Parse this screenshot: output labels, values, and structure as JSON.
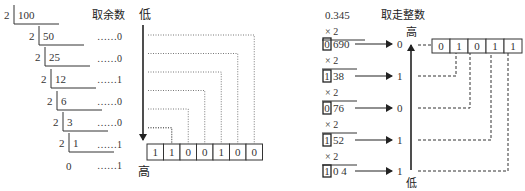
{
  "left": {
    "title": "取余数",
    "divisor": "2",
    "dividends": [
      "100",
      "50",
      "25",
      "12",
      "6",
      "3",
      "1"
    ],
    "final_quotient": "0",
    "remainders": [
      "……0",
      "……0",
      "……1",
      "……0",
      "……0",
      "……1",
      "……1"
    ],
    "arrow_top_label": "低",
    "arrow_bottom_label": "高",
    "result_bits": [
      "1",
      "1",
      "0",
      "0",
      "1",
      "0",
      "0"
    ]
  },
  "right": {
    "title": "取走整数",
    "multiplicand": "0.345",
    "multiplier": "× 2",
    "products": [
      {
        "int": "0",
        "frac": "690",
        "bit": "0"
      },
      {
        "int": "1",
        "frac": "38",
        "bit": "1"
      },
      {
        "int": "0",
        "frac": "76",
        "bit": "0"
      },
      {
        "int": "1",
        "frac": "52",
        "bit": "1"
      },
      {
        "int": "1",
        "frac": "0 4",
        "bit": "1"
      }
    ],
    "arrow_top_label": "高",
    "arrow_bottom_label": "低",
    "result_bits": [
      "0",
      "1",
      "0",
      "1",
      "1"
    ]
  }
}
